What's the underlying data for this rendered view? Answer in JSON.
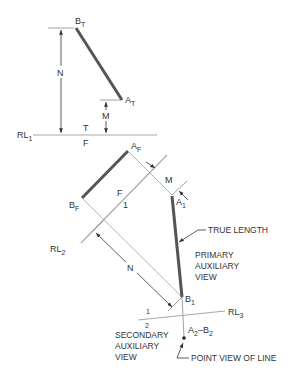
{
  "figure": {
    "type": "descriptive-geometry"
  },
  "colors": {
    "object_line": "#555555",
    "thin_line": "#aaaaaa",
    "dim_line": "#333333",
    "text": "#333333"
  },
  "points": {
    "BT": {
      "main": "B",
      "sub": "T"
    },
    "AT": {
      "main": "A",
      "sub": "T"
    },
    "AF": {
      "main": "A",
      "sub": "F"
    },
    "BF": {
      "main": "B",
      "sub": "F"
    },
    "A1": {
      "main": "A",
      "sub": "1"
    },
    "B1": {
      "main": "B",
      "sub": "1"
    },
    "A2B2": {
      "a": "A",
      "a_sub": "2",
      "dash": "–",
      "b": "B",
      "b_sub": "2"
    }
  },
  "reference_lines": {
    "rl1": {
      "main": "RL",
      "sub": "1",
      "above": "T",
      "below": "F"
    },
    "rl2": {
      "main": "RL",
      "sub": "2",
      "above": "F",
      "below": "1"
    },
    "rl3": {
      "main": "RL",
      "sub": "3",
      "above": "1",
      "below": "2"
    }
  },
  "dimensions": {
    "n_top": "N",
    "m_top": "M",
    "m_aux": "M",
    "n_aux": "N"
  },
  "annotations": {
    "true_length": "TRUE LENGTH",
    "primary_view": [
      "PRIMARY",
      "AUXILIARY",
      "VIEW"
    ],
    "secondary_view": [
      "SECONDARY",
      "AUXILIARY",
      "VIEW"
    ],
    "point_view": "POINT VIEW OF LINE"
  }
}
